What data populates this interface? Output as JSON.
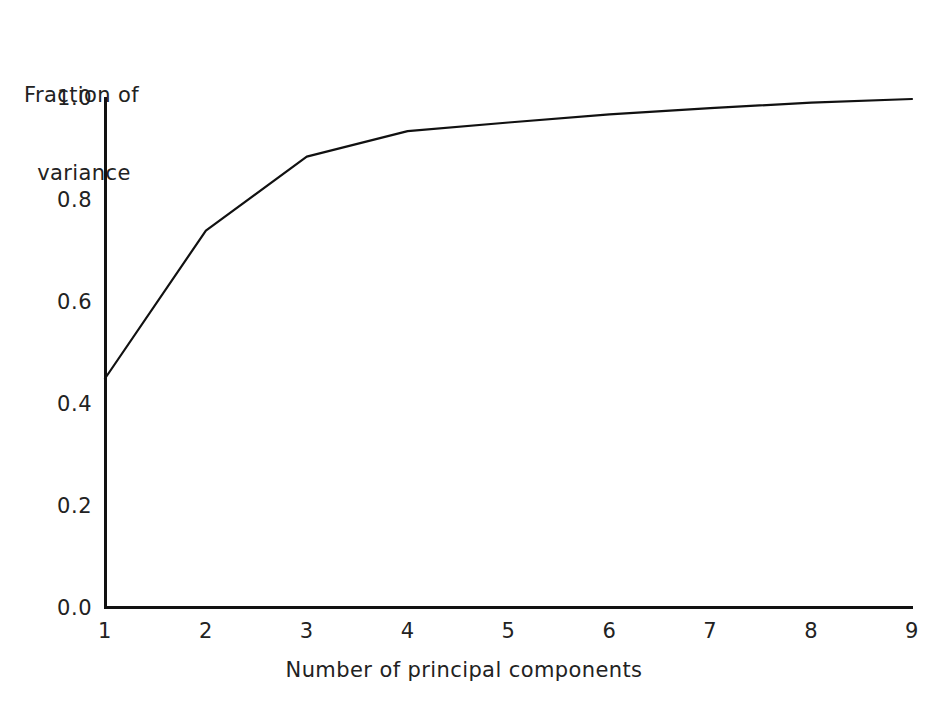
{
  "chart_data": {
    "type": "line",
    "title": "",
    "xlabel": "Number of principal components",
    "ylabel": "Fraction of variance",
    "ylabel_line1": "Fraction of",
    "ylabel_line2": "variance",
    "x": [
      1,
      2,
      3,
      4,
      5,
      6,
      7,
      8,
      9
    ],
    "values": [
      0.45,
      0.74,
      0.885,
      0.935,
      0.952,
      0.968,
      0.98,
      0.991,
      0.998
    ],
    "series": [
      {
        "name": "Cumulative fraction of variance",
        "values": [
          0.45,
          0.74,
          0.885,
          0.935,
          0.952,
          0.968,
          0.98,
          0.991,
          0.998
        ]
      }
    ],
    "xlim": [
      1,
      9
    ],
    "ylim": [
      0.0,
      1.0
    ],
    "xticks": [
      "1",
      "2",
      "3",
      "4",
      "5",
      "6",
      "7",
      "8",
      "9"
    ],
    "xtick_values": [
      1,
      2,
      3,
      4,
      5,
      6,
      7,
      8,
      9
    ],
    "yticks": [
      "0.0",
      "0.2",
      "0.4",
      "0.6",
      "0.8",
      "1.0"
    ],
    "ytick_values": [
      0.0,
      0.2,
      0.4,
      0.6,
      0.8,
      1.0
    ],
    "grid": false,
    "legend": null,
    "legend_position": "none",
    "line_color": "#111111",
    "axis_color": "#111111",
    "background_color": "#ffffff",
    "annotations": []
  }
}
